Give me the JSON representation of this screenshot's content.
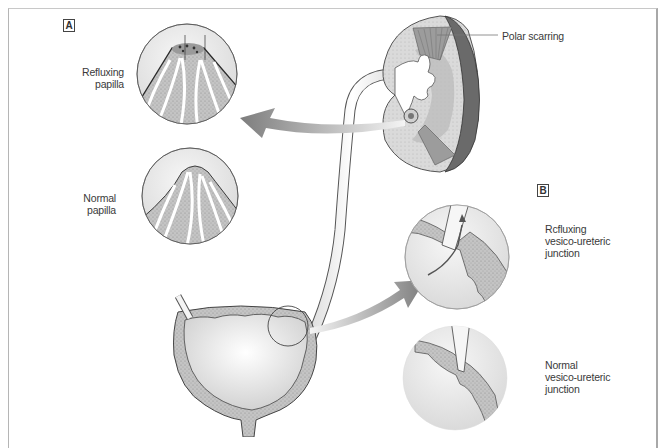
{
  "figure": {
    "panels": [
      {
        "tag": "A"
      },
      {
        "tag": "B"
      }
    ],
    "labels": {
      "refluxing_papilla": [
        "Refluxing",
        "papilla"
      ],
      "normal_papilla": [
        "Normal",
        "papilla"
      ],
      "polar_scarring": "Polar scarring",
      "refluxing_vuj": [
        "Rcfluxing",
        "vesico-ureteric",
        "junction"
      ],
      "normal_vuj": [
        "Normal",
        "vesico-ureteric",
        "junction"
      ]
    },
    "colors": {
      "outline": "#3c3c3c",
      "tissue_stipple": "#b9b9b9",
      "light_fill": "#e6e6e6",
      "arrow_gradient_dark": "#8a8a8a",
      "arrow_gradient_light": "#f2f2f2",
      "scar_dark": "#5c5c5c"
    }
  }
}
